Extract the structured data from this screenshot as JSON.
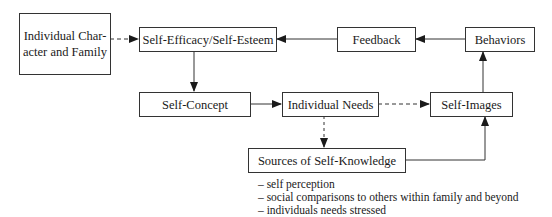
{
  "diagram": {
    "nodes": {
      "individual_character": {
        "line1": "Individual Char-",
        "line2": "acter and Family"
      },
      "self_efficacy": {
        "label": "Self-Efficacy/Self-Esteem"
      },
      "feedback": {
        "label": "Feedback"
      },
      "behaviors": {
        "label": "Behaviors"
      },
      "self_concept": {
        "label": "Self-Concept"
      },
      "individual_needs": {
        "label": "Individual Needs"
      },
      "self_images": {
        "label": "Self-Images"
      },
      "sources": {
        "label": "Sources of Self-Knowledge"
      }
    },
    "edges": [
      {
        "from": "Individual Character and Family",
        "to": "Self-Efficacy/Self-Esteem",
        "style": "dashed"
      },
      {
        "from": "Feedback",
        "to": "Self-Efficacy/Self-Esteem",
        "style": "solid"
      },
      {
        "from": "Behaviors",
        "to": "Feedback",
        "style": "solid"
      },
      {
        "from": "Self-Efficacy/Self-Esteem",
        "to": "Self-Concept",
        "style": "solid"
      },
      {
        "from": "Self-Concept",
        "to": "Individual Needs",
        "style": "solid"
      },
      {
        "from": "Individual Needs",
        "to": "Self-Images",
        "style": "dashed"
      },
      {
        "from": "Individual Needs",
        "to": "Sources of Self-Knowledge",
        "style": "dashed"
      },
      {
        "from": "Sources of Self-Knowledge",
        "to": "Self-Images",
        "style": "solid"
      },
      {
        "from": "Self-Images",
        "to": "Behaviors",
        "style": "solid"
      }
    ],
    "notes": [
      "– self perception",
      "– social comparisons to others within family and beyond",
      "– individuals needs stressed"
    ]
  }
}
